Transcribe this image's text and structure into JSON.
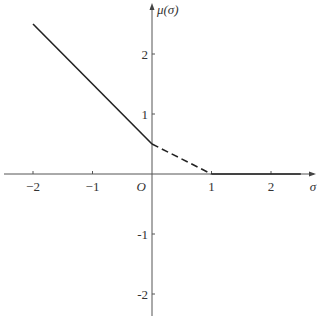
{
  "chart_data": {
    "type": "line",
    "title": "",
    "xlabel": "σ",
    "ylabel": "μ(σ)",
    "origin_label": "O",
    "xlim": [
      -2.5,
      2.5
    ],
    "ylim": [
      -2.3,
      2.5
    ],
    "grid": false,
    "legend": null,
    "x_ticks": [
      -2,
      -1,
      1,
      2
    ],
    "x_tick_labels": [
      "−2",
      "−1",
      "1",
      "2"
    ],
    "y_ticks": [
      2,
      1,
      -1,
      -2
    ],
    "y_tick_labels": [
      "2",
      "1",
      "-1",
      "-2"
    ],
    "series": [
      {
        "name": "solid-left",
        "style": "solid",
        "points": [
          [
            -2,
            2.5
          ],
          [
            0,
            0.5
          ]
        ]
      },
      {
        "name": "dashed-middle",
        "style": "dashed",
        "points": [
          [
            0,
            0.5
          ],
          [
            1,
            0
          ]
        ]
      },
      {
        "name": "solid-right",
        "style": "solid",
        "points": [
          [
            1,
            0
          ],
          [
            2.5,
            0
          ]
        ]
      }
    ]
  }
}
